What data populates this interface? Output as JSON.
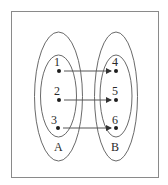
{
  "diagram": {
    "type": "mapping-diagram",
    "sets": [
      {
        "name": "A",
        "label": "A",
        "elements": [
          {
            "label": "1",
            "x": 59,
            "y": 71
          },
          {
            "label": "2",
            "x": 59,
            "y": 100
          },
          {
            "label": "3",
            "x": 58,
            "y": 128
          }
        ]
      },
      {
        "name": "B",
        "label": "B",
        "elements": [
          {
            "label": "4",
            "x": 116,
            "y": 71
          },
          {
            "label": "5",
            "x": 116,
            "y": 100
          },
          {
            "label": "6",
            "x": 116,
            "y": 128
          }
        ]
      }
    ],
    "mappings": [
      {
        "from": "1",
        "to": "4"
      },
      {
        "from": "2",
        "to": "5"
      },
      {
        "from": "3",
        "to": "6"
      }
    ],
    "colors": {
      "frame": "#8a8a8a",
      "ellipse": "#6a6a6a",
      "dot": "#1e1e1e",
      "arrow": "#555555",
      "text": "#2a2a2a"
    }
  }
}
